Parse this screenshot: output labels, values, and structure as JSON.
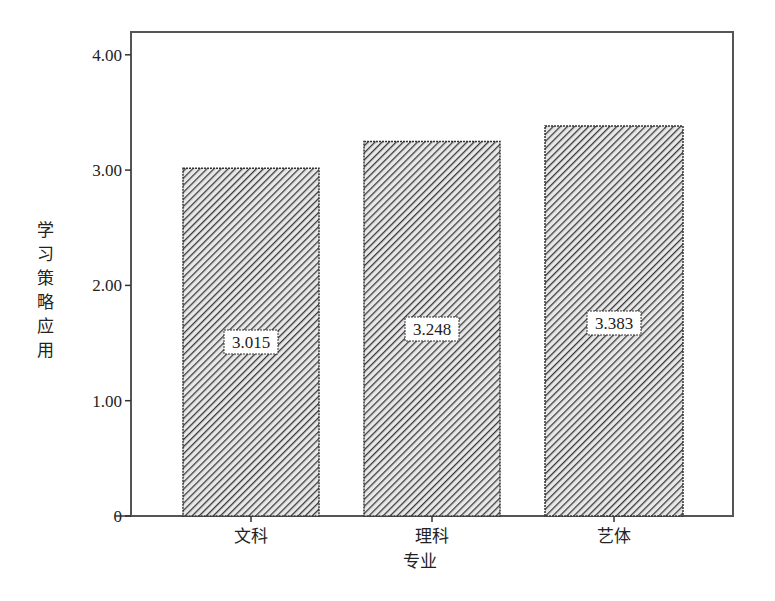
{
  "chart_data": {
    "type": "bar",
    "title": "",
    "xlabel": "专业",
    "ylabel": "学习策略应用",
    "categories": [
      "文科",
      "理科",
      "艺体"
    ],
    "values": [
      3.015,
      3.248,
      3.383
    ],
    "value_labels": [
      "3.015",
      "3.248",
      "3.383"
    ],
    "ylim": [
      0,
      4.2
    ],
    "yticks": [
      0,
      1,
      2,
      3,
      4
    ],
    "ytick_labels": [
      "0",
      "1.00",
      "2.00",
      "3.00",
      "4.00"
    ],
    "grid": false,
    "legend": null,
    "bar_fill": "diagonal-hatch",
    "colors": {
      "bar_stroke": "#333333",
      "hatch": "#3a3a3a",
      "frame": "#555555"
    }
  }
}
